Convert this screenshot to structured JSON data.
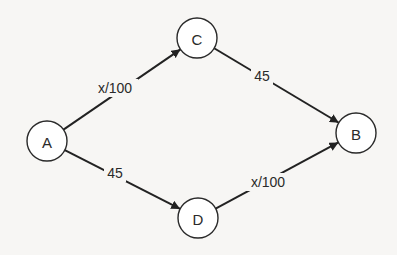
{
  "diagram": {
    "type": "directed-graph",
    "colors": {
      "background": "#f7f6f4",
      "stroke": "#222222",
      "node_fill": "#ffffff",
      "text": "#2a2a2a"
    },
    "nodes": [
      {
        "id": "A",
        "label": "A",
        "cx": 47,
        "cy": 141,
        "r": 20
      },
      {
        "id": "C",
        "label": "C",
        "cx": 197,
        "cy": 38,
        "r": 20
      },
      {
        "id": "B",
        "label": "B",
        "cx": 356,
        "cy": 133,
        "r": 20
      },
      {
        "id": "D",
        "label": "D",
        "cx": 198,
        "cy": 218,
        "r": 20
      }
    ],
    "edges": [
      {
        "from": "A",
        "to": "C",
        "label": "x/100",
        "lx": 115,
        "ly": 88
      },
      {
        "from": "C",
        "to": "B",
        "label": "45",
        "lx": 262,
        "ly": 76
      },
      {
        "from": "A",
        "to": "D",
        "label": "45",
        "lx": 115,
        "ly": 173
      },
      {
        "from": "D",
        "to": "B",
        "label": "x/100",
        "lx": 268,
        "ly": 182
      }
    ]
  }
}
